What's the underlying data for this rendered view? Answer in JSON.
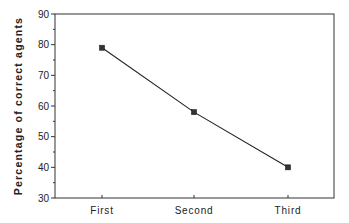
{
  "chart_data": {
    "type": "line",
    "title": "",
    "xlabel": "",
    "ylabel": "Percentage of correct agents",
    "categories": [
      "First",
      "Second",
      "Third"
    ],
    "series": [
      {
        "name": "Percentage of correct agents",
        "values": [
          79,
          58,
          40
        ],
        "marker": "square"
      }
    ],
    "ylim": [
      30,
      90
    ],
    "yticks": [
      30,
      40,
      50,
      60,
      70,
      80,
      90
    ],
    "grid": false,
    "legend": null
  },
  "labels": {
    "ylabel": "Percentage of correct agents",
    "yticks": [
      "30",
      "40",
      "50",
      "60",
      "70",
      "80",
      "90"
    ],
    "categories": [
      "First",
      "Second",
      "Third"
    ]
  }
}
